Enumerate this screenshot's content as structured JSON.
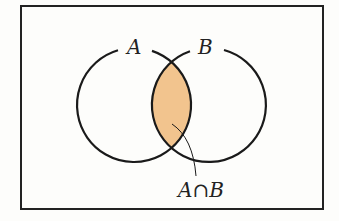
{
  "diagram": {
    "type": "venn",
    "sets": [
      {
        "name": "A",
        "label": "A"
      },
      {
        "name": "B",
        "label": "B"
      }
    ],
    "highlighted_region": "intersection",
    "intersection_label": {
      "left": "A",
      "symbol": "∩",
      "right": "B"
    },
    "colors": {
      "fill": "#F2C48E",
      "stroke": "#1a1a1a",
      "background": "#fdfdfb"
    }
  }
}
